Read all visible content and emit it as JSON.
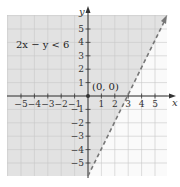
{
  "chart_data": {
    "type": "line",
    "title": "",
    "xlabel": "x",
    "ylabel": "y",
    "xlim": [
      -6,
      6
    ],
    "ylim": [
      -6,
      6
    ],
    "grid": true,
    "x_ticks": [
      -5,
      -4,
      -3,
      -2,
      -1,
      1,
      2,
      3,
      4,
      5
    ],
    "x_tick_labels": [
      "−5",
      "−4",
      "−3",
      "−2",
      "−1",
      "1",
      "2",
      "3",
      "4",
      "5"
    ],
    "y_ticks": [
      5,
      4,
      3,
      2,
      1,
      -1,
      -2,
      -3,
      -4,
      -5
    ],
    "y_tick_labels": [
      "5",
      "4",
      "3",
      "2",
      "1",
      "−1",
      "−2",
      "−3",
      "−4",
      "−5"
    ],
    "series": [
      {
        "name": "boundary 2x − y = 6",
        "style": "dashed",
        "color": "#777777",
        "x": [
          0,
          6
        ],
        "y": [
          -6,
          6
        ]
      }
    ],
    "shaded_region": {
      "inequality": "2x − y < 6",
      "side": "left/above boundary",
      "color": "#e2e2e2"
    },
    "annotations": [
      {
        "text": "2x − y < 6",
        "x": -4,
        "y": 3.5
      },
      {
        "text": "(0, 0)",
        "x": 1,
        "y": 0.6,
        "marker_at": [
          0,
          0
        ]
      }
    ]
  },
  "labels": {
    "inequality": "2x − y < 6",
    "test_point": "(0, 0)",
    "x_axis": "x",
    "y_axis": "y"
  },
  "colors": {
    "shade": "#e2e2e2",
    "grid": "#c8c8c8",
    "axis": "#333333",
    "boundary": "#777777"
  }
}
